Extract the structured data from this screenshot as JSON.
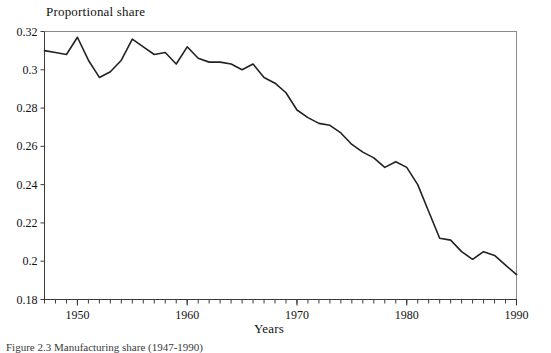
{
  "figure": {
    "background_color": "#ffffff",
    "line_color": "#222222",
    "axis_color": "#3a3a3a",
    "caption": "Figure 2.3 Manufacturing share (1947-1990)"
  },
  "chart_data": {
    "type": "line",
    "title": "",
    "xlabel": "Years",
    "ylabel": "Proportional share",
    "xlim": [
      1947,
      1990
    ],
    "ylim": [
      0.18,
      0.32
    ],
    "grid": false,
    "legend": null,
    "xticks": [
      1950,
      1960,
      1970,
      1980,
      1990
    ],
    "xtick_labels": [
      "1950",
      "1960",
      "1970",
      "1980",
      "1990"
    ],
    "xtick_minor_step": 1,
    "yticks": [
      0.18,
      0.2,
      0.22,
      0.24,
      0.26,
      0.28,
      0.3,
      0.32
    ],
    "ytick_labels": [
      "0.18",
      "0.2",
      "0.22",
      "0.24",
      "0.26",
      "0.28",
      "0.3",
      "0.32"
    ],
    "series": [
      {
        "name": "Proportional share",
        "x": [
          1947,
          1948,
          1949,
          1950,
          1951,
          1952,
          1953,
          1954,
          1955,
          1956,
          1957,
          1958,
          1959,
          1960,
          1961,
          1962,
          1963,
          1964,
          1965,
          1966,
          1967,
          1968,
          1969,
          1970,
          1971,
          1972,
          1973,
          1974,
          1975,
          1976,
          1977,
          1978,
          1979,
          1980,
          1981,
          1982,
          1983,
          1984,
          1985,
          1986,
          1987,
          1988,
          1989,
          1990
        ],
        "values": [
          0.31,
          0.309,
          0.308,
          0.317,
          0.305,
          0.296,
          0.299,
          0.305,
          0.316,
          0.312,
          0.308,
          0.309,
          0.303,
          0.312,
          0.306,
          0.304,
          0.304,
          0.303,
          0.3,
          0.303,
          0.296,
          0.293,
          0.288,
          0.279,
          0.275,
          0.272,
          0.271,
          0.267,
          0.261,
          0.257,
          0.254,
          0.249,
          0.252,
          0.249,
          0.24,
          0.226,
          0.212,
          0.211,
          0.205,
          0.201,
          0.205,
          0.203,
          0.198,
          0.193
        ]
      }
    ]
  }
}
